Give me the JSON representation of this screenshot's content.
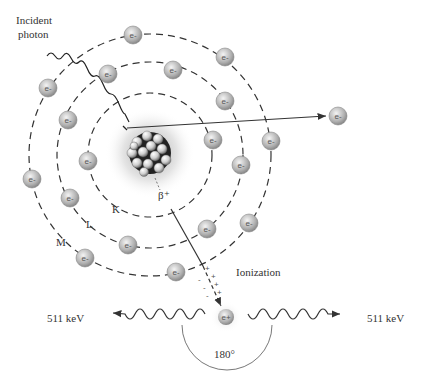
{
  "diagram": {
    "labels": {
      "incident_line1": "Incident",
      "incident_line2": "photon",
      "beta": "β⁺",
      "shell_k": "K",
      "shell_l": "L",
      "shell_m": "M",
      "ionization": "Ionization",
      "energy_left": "511 keV",
      "energy_right": "511 keV",
      "positron": "e+",
      "angle": "180°",
      "electron": "e-"
    },
    "nucleus": {
      "cx": 150,
      "cy": 153,
      "r": 22
    },
    "shells": [
      {
        "name": "K",
        "r": 62
      },
      {
        "name": "L",
        "r": 93
      },
      {
        "name": "M",
        "r": 121
      }
    ],
    "electrons": [
      {
        "x": 133,
        "y": 35
      },
      {
        "x": 225,
        "y": 57
      },
      {
        "x": 48,
        "y": 88
      },
      {
        "x": 108,
        "y": 74
      },
      {
        "x": 173,
        "y": 70
      },
      {
        "x": 225,
        "y": 101
      },
      {
        "x": 68,
        "y": 120
      },
      {
        "x": 213,
        "y": 140
      },
      {
        "x": 271,
        "y": 141
      },
      {
        "x": 88,
        "y": 161
      },
      {
        "x": 241,
        "y": 165
      },
      {
        "x": 32,
        "y": 179
      },
      {
        "x": 70,
        "y": 198
      },
      {
        "x": 128,
        "y": 245
      },
      {
        "x": 85,
        "y": 258
      },
      {
        "x": 207,
        "y": 229
      },
      {
        "x": 249,
        "y": 223
      },
      {
        "x": 176,
        "y": 272
      }
    ],
    "ejected_electron": {
      "x": 338,
      "y": 116
    },
    "colors": {
      "line": "#333333",
      "electron": "#b5b5b5",
      "electron_edge": "#888888"
    }
  }
}
